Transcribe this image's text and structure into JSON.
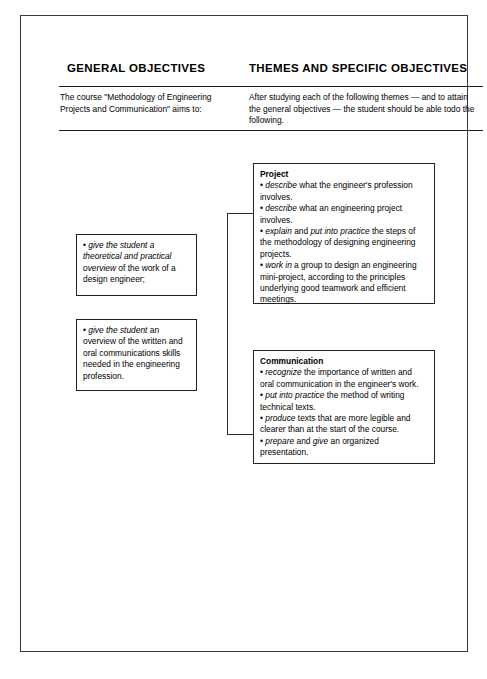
{
  "document": {
    "type": "course-objectives-diagram",
    "columns": {
      "left": {
        "heading": "GENERAL OBJECTIVES",
        "intro": "The course \"Methodology of Engineering Projects and Communication\" aims to:"
      },
      "right": {
        "heading": "THEMES AND SPECIFIC OBJECTIVES",
        "intro": "After studying each of the following themes — and to attain the general objectives — the student should be able todo the following."
      }
    },
    "general_objective_boxes": [
      {
        "id": "general-objective-1",
        "bullet": "•",
        "text_html": "<em>give the student a theoretical and practical overview</em> of the work of a design engineer;",
        "text_plain": "• give the student a theoretical and practical overview of the work of a design engineer;"
      },
      {
        "id": "general-objective-2",
        "bullet": "•",
        "text_html": "<em>give the student</em> an overview of the written and oral communications skills needed in the engineering profession.",
        "text_plain": "• give the student an overview of the written and oral communications skills needed in the engineering profession."
      }
    ],
    "theme_boxes": [
      {
        "id": "theme-project",
        "title": "Project",
        "items_html": [
          "<em>describe</em> what the engineer's profession involves.",
          "<em>describe</em> what an engineering project involves.",
          "<em>explain</em> and <em>put into practice</em> the steps of the methodology of designing engineering projects.",
          "<em>work in</em> a group to design an engineering mini-project, according to the principles underlying good teamwork and efficient meetings."
        ],
        "items_plain": [
          "• describe what the engineer's profession involves.",
          "• describe what an engineering project involves.",
          "• explain and put into practice the steps of the methodology of designing engineering projects.",
          "• work in a group to design an engineering mini-project, according to the principles underlying good teamwork and efficient meetings."
        ]
      },
      {
        "id": "theme-communication",
        "title": "Communication",
        "items_html": [
          "<em>recognize</em> the importance of written and oral communication in the engineer's work.",
          "<em>put into practice</em> the method of writing technical texts.",
          "<em>produce</em> texts that are more legible and clearer than at the start of the course.",
          "<em>prepare</em> and <em>give</em> an organized presentation."
        ],
        "items_plain": [
          "• recognize the importance of written and oral communication in the engineer's work.",
          "• put into practice the method of writing technical texts.",
          "• produce texts that are more legible and clearer than at the start of the course.",
          "• prepare and give an organized presentation."
        ]
      }
    ],
    "colors": {
      "page_background": "#ffffff",
      "text": "#000000",
      "frame_border": "#3a3a3a",
      "box_border": "#222222",
      "rule": "#1d1d1d",
      "connector": "#2b2b2b"
    }
  }
}
